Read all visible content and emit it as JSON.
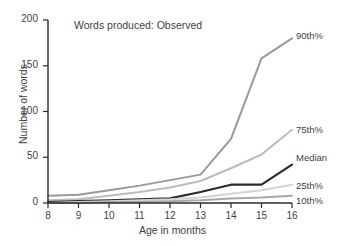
{
  "chart_data": {
    "type": "line",
    "title": "Words produced: Observed",
    "xlabel": "Age in months",
    "ylabel": "Number of words",
    "x": [
      8,
      9,
      10,
      11,
      12,
      13,
      14,
      15,
      16
    ],
    "xticklabels": [
      "8",
      "9",
      "10",
      "11",
      "12",
      "13",
      "14",
      "15",
      "16"
    ],
    "yticklabels": [
      "0",
      "50",
      "100",
      "150",
      "200"
    ],
    "yticks": [
      0,
      50,
      100,
      150,
      200
    ],
    "xlim": [
      8,
      16
    ],
    "ylim": [
      0,
      200
    ],
    "grid": false,
    "legend_position": "right-inline",
    "series": [
      {
        "name": "90th%",
        "label": "90th%",
        "color": "#9a9a9a",
        "values": [
          8,
          9,
          14,
          19,
          25,
          31,
          70,
          158,
          180
        ]
      },
      {
        "name": "75th%",
        "label": "75th%",
        "color": "#bcbcbc",
        "values": [
          3,
          4,
          8,
          12,
          17,
          24,
          38,
          53,
          80
        ]
      },
      {
        "name": "Median",
        "label": "Median",
        "color": "#2b2b2b",
        "values": [
          1,
          2,
          3,
          4,
          5,
          12,
          20,
          20,
          42
        ]
      },
      {
        "name": "25th%",
        "label": "25th%",
        "color": "#d4d4d4",
        "values": [
          0,
          1,
          2,
          3,
          4,
          6,
          10,
          14,
          20
        ]
      },
      {
        "name": "10th%",
        "label": "10th%",
        "color": "#a8a8a8",
        "values": [
          0,
          0,
          1,
          1,
          2,
          3,
          5,
          6,
          8
        ]
      }
    ]
  },
  "axis": {
    "line_color": "#2b2b2b"
  }
}
